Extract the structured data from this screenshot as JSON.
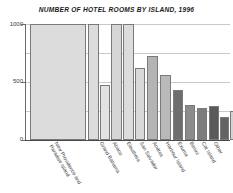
{
  "chart_data": {
    "type": "bar",
    "title": "NUMBER OF HOTEL ROOMS BY ISLAND, 1996",
    "xlabel": "",
    "ylabel": "",
    "ylim": [
      0,
      1000
    ],
    "yticks": [
      0,
      500,
      1000
    ],
    "ytick_labels": [
      "0",
      "500",
      "1000"
    ],
    "grid": true,
    "legend": "none",
    "note": "Leading bars exceed the 1000 axis maximum and are drawn clipped at the top of the plot.",
    "categories": [
      "New Providence and Paradise Island",
      "Grand Bahama",
      "Abaco",
      "Eleuthera",
      "San Salvador",
      "Andros",
      "Harbour Island",
      "Exuma",
      "Bimini",
      "Cat Island",
      "Other"
    ],
    "values": [
      7500,
      1450,
      1000,
      620,
      430,
      300,
      215,
      195,
      200,
      140,
      180
    ],
    "bars": [
      {
        "label": "New Providence and Paradise Island",
        "value": 7500,
        "clipped": true,
        "x": 4,
        "width": 56,
        "height_pct": 100,
        "color": "#dcdcdc"
      },
      {
        "label": "Grand Bahama",
        "value": 1450,
        "clipped": true,
        "x": 62,
        "width": 11,
        "height_pct": 100,
        "color": "#dcdcdc"
      },
      {
        "label": "Grand Bahama",
        "value": 470,
        "clipped": false,
        "x": 74,
        "width": 10,
        "height_pct": 47,
        "color": "#e2e2e2"
      },
      {
        "label": "Abaco",
        "value": 1000,
        "clipped": true,
        "x": 85,
        "width": 11,
        "height_pct": 100,
        "color": "#d6d6d6"
      },
      {
        "label": "Abaco",
        "value": 1000,
        "clipped": true,
        "x": 97,
        "width": 11,
        "height_pct": 100,
        "color": "#dcdcdc"
      },
      {
        "label": "Abaco",
        "value": 620,
        "clipped": false,
        "x": 109,
        "width": 10,
        "height_pct": 62,
        "color": "#d9d9d9"
      },
      {
        "label": "Eleuthera",
        "value": 720,
        "clipped": false,
        "x": 121,
        "width": 11,
        "height_pct": 72,
        "color": "#b4b4b4"
      },
      {
        "label": "San Salvador",
        "value": 560,
        "clipped": false,
        "x": 134,
        "width": 11,
        "height_pct": 56,
        "color": "#b9b9b9"
      },
      {
        "label": "Andros",
        "value": 430,
        "clipped": false,
        "x": 147,
        "width": 10,
        "height_pct": 43,
        "color": "#6e6e6e"
      },
      {
        "label": "Harbour Island",
        "value": 300,
        "clipped": false,
        "x": 159,
        "width": 10,
        "height_pct": 30,
        "color": "#8c8c8c"
      },
      {
        "label": "Exuma",
        "value": 285,
        "clipped": false,
        "x": 171,
        "width": 10,
        "height_pct": 28,
        "color": "#7d7d7d"
      },
      {
        "label": "Bimini",
        "value": 290,
        "clipped": false,
        "x": 183,
        "width": 10,
        "height_pct": 29,
        "color": "#5a5a5a"
      },
      {
        "label": "Cat Island",
        "value": 200,
        "clipped": false,
        "x": 194,
        "width": 9,
        "height_pct": 20,
        "color": "#636363"
      },
      {
        "label": "Other",
        "value": 250,
        "clipped": false,
        "x": 204,
        "width": 9,
        "height_pct": 25,
        "color": "#d2d2d2"
      }
    ],
    "tick_labels_rotated": true
  },
  "axis": {
    "y": {
      "t0": "0",
      "t1": "500",
      "t2": "1000"
    }
  },
  "xaxis_labels": [
    {
      "line1": "New Providence and",
      "line2": "Paradise Island"
    },
    {
      "line1": "Grand Bahama",
      "line2": ""
    },
    {
      "line1": "Abaco",
      "line2": ""
    },
    {
      "line1": "Eleuthera",
      "line2": ""
    },
    {
      "line1": "San Salvador",
      "line2": ""
    },
    {
      "line1": "Andros",
      "line2": ""
    },
    {
      "line1": "Harbour Island",
      "line2": ""
    },
    {
      "line1": "Exuma",
      "line2": ""
    },
    {
      "line1": "Bimini",
      "line2": ""
    },
    {
      "line1": "Cat Island",
      "line2": ""
    },
    {
      "line1": "Other",
      "line2": ""
    }
  ],
  "colors": {
    "grid": "#c9c9c9",
    "axis": "#4a4a4a",
    "text": "#2b2b2b",
    "background": "#ffffff"
  }
}
